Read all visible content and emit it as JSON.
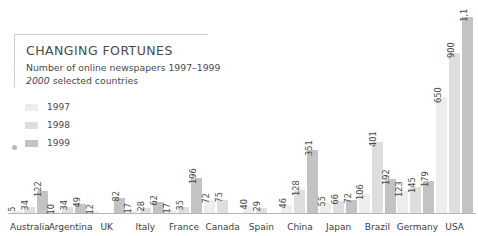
{
  "title": "CHANGING FORTUNES",
  "subtitle": "Number of online newspapers 1997–1999",
  "subtitle2_emphasis": "2000",
  "subtitle2_rest": " selected countries",
  "legend": [
    {
      "label": "1997",
      "color": "#ededed"
    },
    {
      "label": "1998",
      "color": "#dedede"
    },
    {
      "label": "1999",
      "color": "#c3c3c3"
    }
  ],
  "colors": {
    "series_1997": "#ededed",
    "series_1998": "#dedede",
    "series_1999": "#c3c3c3",
    "axis": "#b5b5b5",
    "text": "#4a4a4a",
    "frame": "#cfcfcf"
  },
  "chart_data": {
    "type": "bar",
    "title": "CHANGING FORTUNES",
    "subtitle": "Number of online newspapers 1997–1999, 2000 selected countries",
    "xlabel": "",
    "ylabel": "",
    "grid": false,
    "legend_position": "upper-left",
    "ylim": [
      0,
      1100
    ],
    "categories": [
      "Australia",
      "Argentina",
      "UK",
      "Italy",
      "France",
      "Canada",
      "Spain",
      "China",
      "Japan",
      "Brazil",
      "Germany",
      "USA"
    ],
    "series": [
      {
        "name": "1997",
        "values": [
          5,
          10,
          12,
          17,
          17,
          72,
          40,
          46,
          55,
          106,
          123,
          650
        ]
      },
      {
        "name": "1998",
        "values": [
          34,
          34,
          null,
          28,
          35,
          75,
          29,
          128,
          66,
          401,
          145,
          900
        ]
      },
      {
        "name": "1999",
        "values": [
          122,
          49,
          82,
          62,
          196,
          null,
          null,
          351,
          72,
          192,
          179,
          1100
        ]
      }
    ],
    "value_labels": [
      {
        "category": "Australia",
        "labels": [
          "5",
          "34",
          "122"
        ]
      },
      {
        "category": "Argentina",
        "labels": [
          "10",
          "34",
          "49"
        ]
      },
      {
        "category": "UK",
        "labels": [
          "12",
          "",
          "82"
        ]
      },
      {
        "category": "Italy",
        "labels": [
          "17",
          "28",
          "62"
        ]
      },
      {
        "category": "France",
        "labels": [
          "17",
          "35",
          "196"
        ]
      },
      {
        "category": "Canada",
        "labels": [
          "72",
          "75",
          ""
        ]
      },
      {
        "category": "Spain",
        "labels": [
          "40",
          "29",
          ""
        ]
      },
      {
        "category": "China",
        "labels": [
          "46",
          "128",
          "351"
        ]
      },
      {
        "category": "Japan",
        "labels": [
          "55",
          "66",
          "72"
        ]
      },
      {
        "category": "Brazil",
        "labels": [
          "106",
          "401",
          "192"
        ]
      },
      {
        "category": "Germany",
        "labels": [
          "123",
          "145",
          "179"
        ]
      },
      {
        "category": "USA",
        "labels": [
          "650",
          "900",
          "1,1"
        ]
      }
    ]
  }
}
